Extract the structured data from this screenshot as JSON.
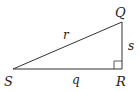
{
  "diagram": {
    "type": "right-triangle",
    "vertices": {
      "S": {
        "label": "S",
        "x": 13,
        "y": 69
      },
      "R": {
        "label": "R",
        "x": 122,
        "y": 69
      },
      "Q": {
        "label": "Q",
        "x": 122,
        "y": 22
      }
    },
    "sides": {
      "q": {
        "label": "q",
        "from": "S",
        "to": "R"
      },
      "s": {
        "label": "s",
        "from": "R",
        "to": "Q"
      },
      "r": {
        "label": "r",
        "from": "S",
        "to": "Q"
      }
    },
    "right_angle_at": "R",
    "stroke_color": "#333333"
  }
}
